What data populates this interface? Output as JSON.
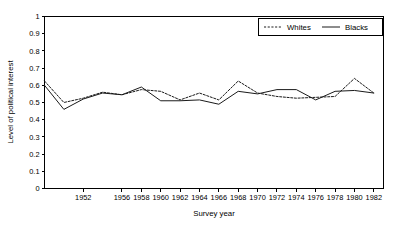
{
  "chart_data": {
    "type": "line",
    "title": "",
    "xlabel": "Survey year",
    "ylabel": "Level of political interest",
    "xlim": [
      1948,
      1983
    ],
    "ylim": [
      0,
      1
    ],
    "grid": false,
    "legend_position": "top-right",
    "y_ticks": [
      "0",
      "0.1",
      "0.2",
      "0.3",
      "0.4",
      "0.5",
      "0.6",
      "0.7",
      "0.8",
      "0.9",
      "1"
    ],
    "y_tick_values": [
      0,
      0.1,
      0.2,
      0.3,
      0.4,
      0.5,
      0.6,
      0.7,
      0.8,
      0.9,
      1
    ],
    "x_ticks": [
      "1952",
      "1956",
      "1958",
      "1960",
      "1962",
      "1964",
      "1966",
      "1968",
      "1970",
      "1972",
      "1974",
      "1976",
      "1978",
      "1980",
      "1982"
    ],
    "x_tick_values": [
      1952,
      1956,
      1958,
      1960,
      1962,
      1964,
      1966,
      1968,
      1970,
      1972,
      1974,
      1976,
      1978,
      1980,
      1982
    ],
    "x": [
      1948,
      1950,
      1952,
      1954,
      1956,
      1958,
      1960,
      1962,
      1964,
      1966,
      1968,
      1970,
      1972,
      1974,
      1976,
      1978,
      1980,
      1982
    ],
    "series": [
      {
        "name": "Whites",
        "style": "dashed",
        "color": "#1a1a1a",
        "values": [
          0.625,
          0.5,
          0.525,
          0.56,
          0.545,
          0.575,
          0.565,
          0.515,
          0.555,
          0.515,
          0.625,
          0.555,
          0.535,
          0.525,
          0.53,
          0.535,
          0.64,
          0.555
        ]
      },
      {
        "name": "Blacks",
        "style": "solid",
        "color": "#1a1a1a",
        "values": [
          0.6,
          0.46,
          0.52,
          0.555,
          0.545,
          0.59,
          0.51,
          0.51,
          0.515,
          0.49,
          0.565,
          0.55,
          0.575,
          0.575,
          0.515,
          0.565,
          0.57,
          0.555
        ]
      }
    ]
  },
  "legend": {
    "items": [
      {
        "label": "Whites",
        "style": "dashed"
      },
      {
        "label": "Blacks",
        "style": "solid"
      }
    ]
  }
}
